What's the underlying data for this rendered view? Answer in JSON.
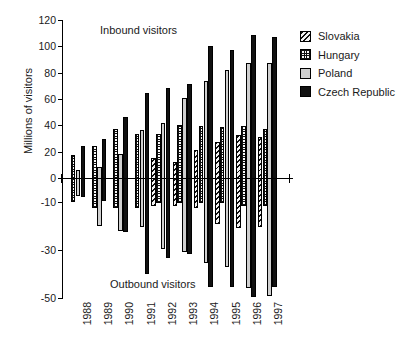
{
  "chart_data": {
    "type": "bar",
    "title": "",
    "xlabel": "",
    "ylabel": "Millions of visitors",
    "categories": [
      "1988",
      "1989",
      "1990",
      "1991",
      "1992",
      "1993",
      "1994",
      "1995",
      "1996",
      "1997"
    ],
    "ytick_labels": [
      "120",
      "100",
      "80",
      "60",
      "40",
      "20",
      "0",
      "-10",
      "-30",
      "-50"
    ],
    "ytick_values": [
      120,
      100,
      80,
      60,
      40,
      20,
      0,
      -10,
      -30,
      -50
    ],
    "ylim": [
      -50,
      120
    ],
    "note": "Positive and negative halves of the axis use different scales; inbound visitors plotted upward, outbound visitors plotted downward.",
    "grid": false,
    "legend_position": "right",
    "annotations": [
      {
        "text": "Inbound visitors",
        "area": "upper-left-of-plot"
      },
      {
        "text": "Outbound visitors",
        "area": "lower-center-of-plot"
      }
    ],
    "series": [
      {
        "name": "Slovakia",
        "pattern": "diagonal-hatch",
        "color": "#f2f2f2",
        "inbound": [
          null,
          null,
          null,
          null,
          15.0,
          12.5,
          21.5,
          27.0,
          33.0,
          31.5
        ],
        "outbound": [
          null,
          null,
          null,
          null,
          -11.5,
          -11.5,
          -12.5,
          -19.0,
          -21.0,
          -20.5
        ]
      },
      {
        "name": "Hungary",
        "pattern": "checkered",
        "color": "#fafafa",
        "inbound": [
          17.5,
          24.5,
          37.5,
          33.5,
          33.5,
          40.0,
          39.5,
          39.0,
          39.5,
          37.0
        ],
        "outbound": [
          -10.0,
          -12.5,
          -12.5,
          -12.5,
          -10.5,
          -10.5,
          -10.5,
          -10.5,
          -11.5,
          -11.5
        ]
      },
      {
        "name": "Poland",
        "pattern": "solid-light-gray",
        "color": "#cfcfcf",
        "inbound": [
          6.0,
          8.0,
          18.0,
          36.8,
          42.0,
          61.0,
          74.0,
          82.0,
          87.0,
          87.0
        ],
        "outbound": [
          -7.5,
          -20.0,
          -22.0,
          -20.5,
          -29.5,
          -31.0,
          -35.5,
          -37.0,
          -46.0,
          -49.0
        ]
      },
      {
        "name": "Czech Republic",
        "pattern": "solid-black",
        "color": "#111111",
        "inbound": [
          24.5,
          29.5,
          46.0,
          64.5,
          68.5,
          71.5,
          100.5,
          97.5,
          108.5,
          107.0
        ],
        "outbound": [
          -8.0,
          -9.5,
          -22.5,
          -40.0,
          -33.5,
          -31.5,
          -45.5,
          -45.5,
          -49.5,
          -45.5
        ]
      }
    ]
  },
  "legend": {
    "items": [
      {
        "label": "Slovakia",
        "swatch": "diagonal-hatch"
      },
      {
        "label": "Hungary",
        "swatch": "checkered"
      },
      {
        "label": "Poland",
        "swatch": "solid-light-gray"
      },
      {
        "label": "Czech Republic",
        "swatch": "solid-black"
      }
    ]
  },
  "axis": {
    "y_title": "Millions of visitors"
  },
  "annotations": {
    "inbound": "Inbound visitors",
    "outbound": "Outbound visitors"
  }
}
